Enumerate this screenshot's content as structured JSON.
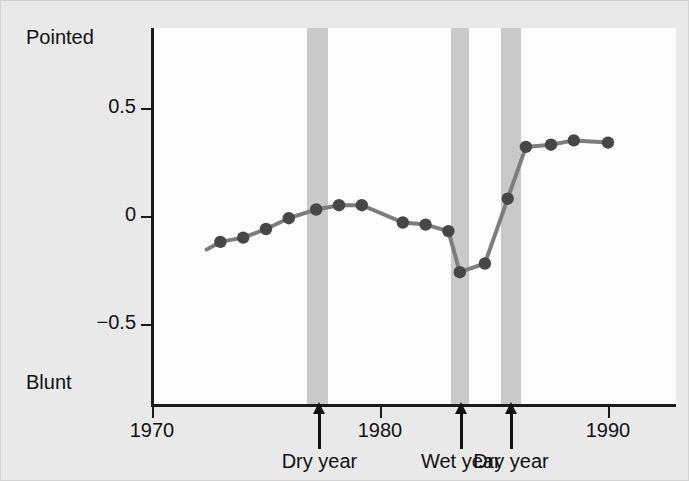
{
  "figure": {
    "background_color": "#e9e9e9",
    "plot_background_color": "#fdfdfd",
    "band_color": "#c9c9c9",
    "line_color": "#7d7d7d",
    "marker_color": "#474747",
    "axis_color": "#1a1a1a"
  },
  "axis": {
    "y_top_label": "Pointed",
    "y_bottom_label": "Blunt",
    "y_ticks": [
      {
        "value": 0.5,
        "label": "0.5"
      },
      {
        "value": 0,
        "label": "0"
      },
      {
        "value": -0.5,
        "label": "−0.5"
      }
    ],
    "x_ticks": [
      {
        "value": 1970,
        "label": "1970"
      },
      {
        "value": 1980,
        "label": "1980"
      },
      {
        "value": 1990,
        "label": "1990"
      }
    ]
  },
  "annotations": [
    {
      "name": "dry-year-1977",
      "year": 1977.3,
      "label": "Dry year"
    },
    {
      "name": "wet-year-1983",
      "year": 1983.5,
      "label": "Wet year"
    },
    {
      "name": "dry-year-1985",
      "year": 1985.7,
      "label": "Dry year"
    }
  ],
  "event_bands": [
    {
      "name": "dry-year-1977",
      "start": 1976.8,
      "end": 1977.7
    },
    {
      "name": "wet-year-1983",
      "start": 1983.1,
      "end": 1983.9
    },
    {
      "name": "dry-year-1985",
      "start": 1985.3,
      "end": 1986.2
    }
  ],
  "chart_data": {
    "type": "line",
    "title": "",
    "xlabel": "",
    "ylabel": "",
    "xlim": [
      1970,
      1991.5
    ],
    "ylim": [
      -0.85,
      0.87
    ],
    "grid": false,
    "legend": null,
    "y_axis_endpoints": {
      "high": "Pointed",
      "low": "Blunt"
    },
    "x": [
      1973.0,
      1974.0,
      1975.0,
      1976.0,
      1977.2,
      1978.2,
      1979.2,
      1981.0,
      1982.0,
      1983.0,
      1983.5,
      1984.6,
      1985.6,
      1986.4,
      1987.5,
      1988.5,
      1990.0
    ],
    "values": [
      -0.12,
      -0.1,
      -0.06,
      -0.01,
      0.03,
      0.05,
      0.05,
      -0.03,
      -0.04,
      -0.07,
      -0.26,
      -0.22,
      0.08,
      0.32,
      0.33,
      0.35,
      0.34
    ],
    "series": [
      {
        "name": "beak shape index",
        "values": [
          -0.12,
          -0.1,
          -0.06,
          -0.01,
          0.03,
          0.05,
          0.05,
          -0.03,
          -0.04,
          -0.07,
          -0.26,
          -0.22,
          0.08,
          0.32,
          0.33,
          0.35,
          0.34
        ]
      }
    ],
    "lead_in_segment": {
      "from_x": 1972.4,
      "from_y": -0.155,
      "to_x": 1973.0,
      "to_y": -0.12
    }
  }
}
